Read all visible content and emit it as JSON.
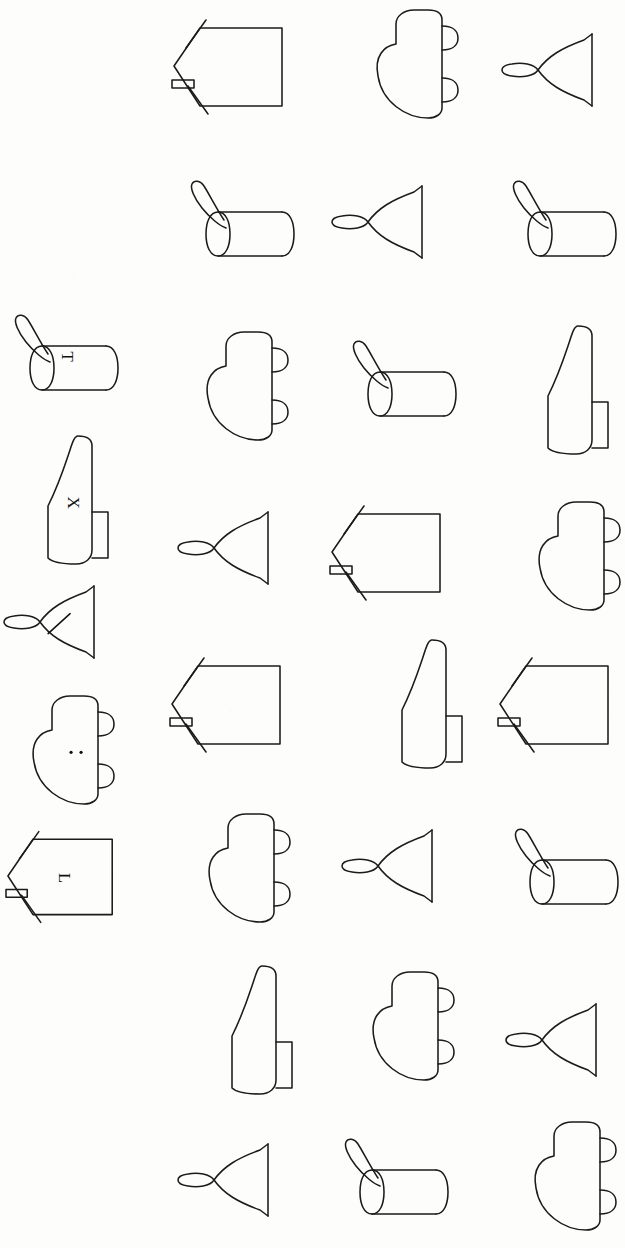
{
  "sheet": {
    "title": "Rotated object line-drawing sheet",
    "background_color": "#fdfdfc",
    "ink_color": "#1b1b1b",
    "width": 608,
    "height": 1248,
    "columns": 4,
    "rows": 9,
    "description": "Mental-rotation style sheet of outline objects: house/envelope, car, bell, cylinder-with-loop, boot."
  },
  "shape_names": {
    "house": "house-shape",
    "car": "car-shape",
    "bell": "bell-shape",
    "cylinder": "cylinder-shape",
    "boot": "boot-shape"
  },
  "probe_column": {
    "label": "labelled-probe-column",
    "items": [
      {
        "shape": "cylinder",
        "mark": "T",
        "mark_type": "letter",
        "x": 10,
        "y": 312,
        "w": 110,
        "h": 86,
        "rotation": 0
      },
      {
        "shape": "boot",
        "mark": "X",
        "mark_type": "letter",
        "x": 28,
        "y": 432,
        "w": 88,
        "h": 136,
        "rotation": 0
      },
      {
        "shape": "bell",
        "mark": "/",
        "mark_type": "slash",
        "x": 2,
        "y": 582,
        "w": 104,
        "h": 80,
        "rotation": 0
      },
      {
        "shape": "car",
        "mark": "..",
        "mark_type": "dots",
        "x": 22,
        "y": 692,
        "w": 104,
        "h": 116,
        "rotation": 0
      },
      {
        "shape": "house",
        "mark": "L",
        "mark_type": "letter",
        "x": 6,
        "y": 822,
        "w": 112,
        "h": 108,
        "rotation": 0
      }
    ]
  },
  "grid": {
    "label": "object-grid",
    "column_x": [
      165,
      320,
      472
    ],
    "cells": [
      {
        "row": 0,
        "col": 0,
        "shape": "house",
        "x": 172,
        "y": 14,
        "w": 116,
        "h": 104
      },
      {
        "row": 0,
        "col": 1,
        "shape": "car",
        "x": 366,
        "y": 6,
        "w": 104,
        "h": 116
      },
      {
        "row": 0,
        "col": 2,
        "shape": "bell",
        "x": 500,
        "y": 30,
        "w": 104,
        "h": 80
      },
      {
        "row": 1,
        "col": 0,
        "shape": "cylinder",
        "x": 186,
        "y": 178,
        "w": 110,
        "h": 86
      },
      {
        "row": 1,
        "col": 1,
        "shape": "bell",
        "x": 330,
        "y": 182,
        "w": 104,
        "h": 80
      },
      {
        "row": 1,
        "col": 2,
        "shape": "cylinder",
        "x": 508,
        "y": 178,
        "w": 110,
        "h": 86
      },
      {
        "row": 2,
        "col": 0,
        "shape": "car",
        "x": 196,
        "y": 328,
        "w": 104,
        "h": 116
      },
      {
        "row": 2,
        "col": 1,
        "shape": "cylinder",
        "x": 348,
        "y": 338,
        "w": 110,
        "h": 86
      },
      {
        "row": 2,
        "col": 2,
        "shape": "boot",
        "x": 528,
        "y": 322,
        "w": 88,
        "h": 136
      },
      {
        "row": 3,
        "col": 0,
        "shape": "bell",
        "x": 176,
        "y": 508,
        "w": 104,
        "h": 80
      },
      {
        "row": 3,
        "col": 1,
        "shape": "house",
        "x": 330,
        "y": 500,
        "w": 116,
        "h": 104
      },
      {
        "row": 3,
        "col": 2,
        "shape": "car",
        "x": 528,
        "y": 498,
        "w": 104,
        "h": 116
      },
      {
        "row": 4,
        "col": 0,
        "shape": "house",
        "x": 170,
        "y": 652,
        "w": 116,
        "h": 104
      },
      {
        "row": 4,
        "col": 1,
        "shape": "boot",
        "x": 382,
        "y": 636,
        "w": 88,
        "h": 136
      },
      {
        "row": 4,
        "col": 2,
        "shape": "house",
        "x": 498,
        "y": 652,
        "w": 116,
        "h": 104
      },
      {
        "row": 5,
        "col": 0,
        "shape": "car",
        "x": 198,
        "y": 810,
        "w": 104,
        "h": 116
      },
      {
        "row": 5,
        "col": 1,
        "shape": "bell",
        "x": 340,
        "y": 826,
        "w": 104,
        "h": 80
      },
      {
        "row": 5,
        "col": 2,
        "shape": "cylinder",
        "x": 510,
        "y": 826,
        "w": 110,
        "h": 86
      },
      {
        "row": 6,
        "col": 0,
        "shape": "boot",
        "x": 212,
        "y": 962,
        "w": 88,
        "h": 136
      },
      {
        "row": 6,
        "col": 1,
        "shape": "car",
        "x": 362,
        "y": 968,
        "w": 104,
        "h": 116
      },
      {
        "row": 6,
        "col": 2,
        "shape": "bell",
        "x": 504,
        "y": 1000,
        "w": 104,
        "h": 80
      },
      {
        "row": 7,
        "col": 0,
        "shape": "bell",
        "x": 176,
        "y": 1140,
        "w": 104,
        "h": 80
      },
      {
        "row": 7,
        "col": 1,
        "shape": "cylinder",
        "x": 340,
        "y": 1136,
        "w": 110,
        "h": 86
      },
      {
        "row": 7,
        "col": 2,
        "shape": "car",
        "x": 524,
        "y": 1118,
        "w": 104,
        "h": 116
      }
    ]
  }
}
